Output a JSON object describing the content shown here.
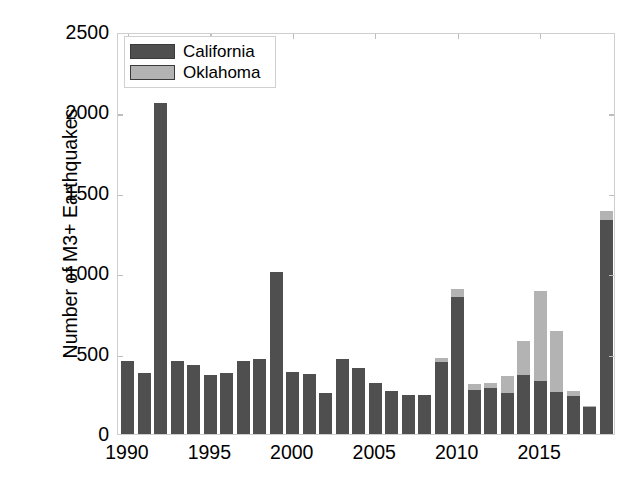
{
  "chart_data": {
    "type": "bar",
    "subtype": "stacked",
    "title": "",
    "xlabel": "",
    "ylabel": "Number of M3+ Earthquakes",
    "xlim": [
      1989.4,
      2019.6
    ],
    "ylim": [
      0,
      2500
    ],
    "yticks": [
      0,
      500,
      1000,
      1500,
      2000,
      2500
    ],
    "ytick_labels": [
      "0",
      "500",
      "1000",
      "1500",
      "2000",
      "2500"
    ],
    "xticks": [
      1990,
      1995,
      2000,
      2005,
      2010,
      2015
    ],
    "xtick_labels": [
      "1990",
      "1995",
      "2000",
      "2005",
      "2010",
      "2015"
    ],
    "grid": false,
    "legend_position": "upper left",
    "categories": [
      1990,
      1991,
      1992,
      1993,
      1994,
      1995,
      1996,
      1997,
      1998,
      1999,
      2000,
      2001,
      2002,
      2003,
      2004,
      2005,
      2006,
      2007,
      2008,
      2009,
      2010,
      2011,
      2012,
      2013,
      2014,
      2015,
      2016,
      2017,
      2018,
      2019
    ],
    "series": [
      {
        "name": "California",
        "color": "#4f4f4f",
        "values": [
          455,
          380,
          2060,
          455,
          430,
          370,
          380,
          455,
          465,
          1010,
          385,
          375,
          255,
          465,
          410,
          315,
          265,
          245,
          245,
          450,
          855,
          275,
          285,
          255,
          370,
          330,
          260,
          235,
          170,
          1330
        ]
      },
      {
        "name": "Oklahoma",
        "color": "#b3b3b3",
        "values": [
          0,
          0,
          0,
          0,
          0,
          0,
          0,
          0,
          0,
          0,
          0,
          0,
          0,
          0,
          0,
          0,
          0,
          0,
          0,
          20,
          45,
          35,
          35,
          105,
          210,
          560,
          380,
          30,
          5,
          60
        ]
      }
    ]
  },
  "legend": {
    "items": [
      {
        "label": "California",
        "color": "#4f4f4f"
      },
      {
        "label": "Oklahoma",
        "color": "#b3b3b3"
      }
    ]
  }
}
